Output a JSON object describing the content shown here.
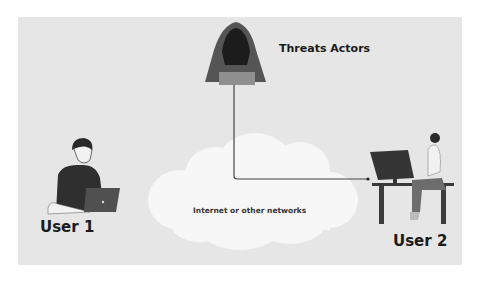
{
  "diagram": {
    "background_color": "#e6e6e6",
    "nodes": [
      {
        "id": "threat",
        "label": "Threats Actors",
        "icon": "hooded-hacker-icon"
      },
      {
        "id": "user1",
        "label": "User 1",
        "icon": "person-laptop-icon"
      },
      {
        "id": "user2",
        "label": "User 2",
        "icon": "person-desk-computer-icon"
      },
      {
        "id": "network",
        "label": "Internet or other networks",
        "icon": "cloud-icon"
      }
    ],
    "edges": [
      {
        "from": "threat",
        "to": "user2",
        "style": "elbow-arrow"
      }
    ]
  },
  "labels": {
    "threat": "Threats Actors",
    "user1": "User 1",
    "user2": "User 2",
    "network": "Internet or other networks"
  },
  "colors": {
    "panel": "#e6e6e6",
    "cloud": "#f7f7f7",
    "dark": "#3a3a3a",
    "line": "#444444"
  }
}
